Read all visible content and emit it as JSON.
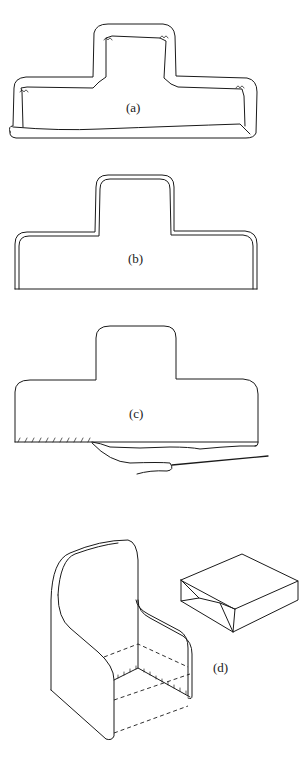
{
  "figure": {
    "panels": [
      {
        "id": "a",
        "label": "(a)",
        "description": "T-shaped fabric piece with raw edges overcast, bottom edge folded"
      },
      {
        "id": "b",
        "label": "(b)",
        "description": "T-shaped piece with edges turned and hemmed"
      },
      {
        "id": "c",
        "label": "(c)",
        "description": "T-shaped piece with bottom edge being hand-stitched with needle and thread"
      },
      {
        "id": "d",
        "label": "(d)",
        "description": "Finished slipcover on armchair with seat cushion box"
      }
    ],
    "colors": {
      "ink": "#1a1a1a",
      "paper": "#ffffff"
    }
  }
}
